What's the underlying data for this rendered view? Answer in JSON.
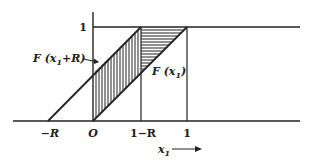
{
  "diagram": {
    "type": "cumulative-distribution-shift",
    "colors": {
      "ink": "#222222",
      "background": "#ffffff"
    },
    "axis": {
      "y_tick_label": "1",
      "x_tick_labels": [
        "−R",
        "O",
        "1−R",
        "1"
      ],
      "x_axis_label": "x",
      "x_axis_label_sub": "1",
      "x_axis_arrow": "⟶"
    },
    "curves": [
      {
        "name": "F(x1+R)",
        "label_main": "F (x",
        "label_sub": "1",
        "label_tail": "+R)",
        "points": [
          [
            -1.0,
            0
          ],
          [
            -0.5,
            0
          ],
          [
            0.5,
            1
          ],
          [
            1.2,
            1
          ]
        ]
      },
      {
        "name": "F(x1)",
        "label_main": "F (x",
        "label_sub": "1",
        "label_tail": ")",
        "points": [
          [
            0,
            0
          ],
          [
            1,
            1
          ]
        ]
      }
    ],
    "regions": [
      {
        "name": "vertical-hatch",
        "x_range": [
          "0",
          "1−R"
        ],
        "between": [
          "F(x1)",
          "F(x1+R)"
        ]
      },
      {
        "name": "horizontal-hatch",
        "x_range": [
          "1−R",
          "1"
        ],
        "between": [
          "F(x1)",
          "1"
        ]
      }
    ]
  }
}
